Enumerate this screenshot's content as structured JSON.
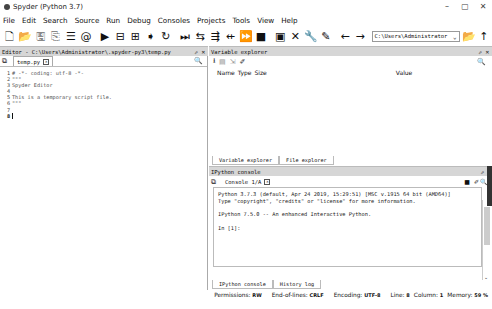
{
  "window": {
    "title": "Spyder (Python 3.7)",
    "controls": [
      "–",
      "▢",
      "✕"
    ]
  },
  "menu": [
    "File",
    "Edit",
    "Search",
    "Source",
    "Run",
    "Debug",
    "Consoles",
    "Projects",
    "Tools",
    "View",
    "Help"
  ],
  "toolbar": {
    "icons": [
      {
        "name": "new-file-icon",
        "glyph": "🗋"
      },
      {
        "name": "open-file-icon",
        "glyph": "📂"
      },
      {
        "name": "save-icon",
        "glyph": "🖫"
      },
      {
        "name": "save-all-icon",
        "glyph": "⎘"
      },
      {
        "name": "outline-icon",
        "glyph": "☰"
      },
      {
        "name": "preferences-icon",
        "glyph": "@"
      },
      {
        "name": "run-icon",
        "glyph": "▶"
      },
      {
        "name": "run-cell-icon",
        "glyph": "⊟"
      },
      {
        "name": "run-cell-advance-icon",
        "glyph": "⊞"
      },
      {
        "name": "run-selection-icon",
        "glyph": "➧"
      },
      {
        "name": "rerun-icon",
        "glyph": "↻"
      },
      {
        "name": "debug-icon",
        "glyph": "⏭"
      },
      {
        "name": "step-icon",
        "glyph": "⇆"
      },
      {
        "name": "step-into-icon",
        "glyph": "⇶"
      },
      {
        "name": "step-return-icon",
        "glyph": "⇷"
      },
      {
        "name": "continue-icon",
        "glyph": "⏩"
      },
      {
        "name": "stop-icon",
        "glyph": "■"
      },
      {
        "name": "maximize-pane-icon",
        "glyph": "▣"
      },
      {
        "name": "fullscreen-icon",
        "glyph": "✕"
      },
      {
        "name": "tools-icon",
        "glyph": "🔧"
      },
      {
        "name": "pythonpath-icon",
        "glyph": "✎"
      },
      {
        "name": "back-icon",
        "glyph": "←"
      },
      {
        "name": "forward-icon",
        "glyph": "→"
      }
    ],
    "path": "C:\\Users\\Administrator",
    "browse_glyph": "📂",
    "up_glyph": "↑"
  },
  "editor": {
    "header": "Editor - C:\\Users\\Administrator\\.spyder-py3\\temp.py",
    "header_controls": "⇗ ✕",
    "tab": "temp.py",
    "lines": [
      {
        "n": "1",
        "t": "# -*- coding: utf-8 -*-"
      },
      {
        "n": "2",
        "t": "\"\"\""
      },
      {
        "n": "3",
        "t": "Spyder Editor"
      },
      {
        "n": "4",
        "t": ""
      },
      {
        "n": "5",
        "t": "This is a temporary script file."
      },
      {
        "n": "6",
        "t": "\"\"\""
      },
      {
        "n": "7",
        "t": ""
      },
      {
        "n": "8",
        "t": ""
      }
    ]
  },
  "variable_explorer": {
    "header": "Variable explorer",
    "header_controls": "⇗ ✕",
    "columns": [
      "Name",
      "Type",
      "Size",
      "Value"
    ],
    "tabs": [
      "Variable explorer",
      "File explorer"
    ]
  },
  "console": {
    "header": "IPython console",
    "header_controls": "⇗",
    "tab": "Console 1/A",
    "output": [
      "Python 3.7.3 (default, Apr 24 2019, 15:29:51) [MSC v.1915 64 bit (AMD64)]",
      "Type \"copyright\", \"credits\" or \"license\" for more information.",
      "",
      "IPython 7.5.0 -- An enhanced Interactive Python.",
      "",
      "In [1]:"
    ],
    "tabs": [
      "IPython console",
      "History log"
    ]
  },
  "status": {
    "permissions_label": "Permissions:",
    "permissions": "RW",
    "eol_label": "End-of-lines:",
    "eol": "CRLF",
    "encoding_label": "Encoding:",
    "encoding": "UTF-8",
    "line_label": "Line:",
    "line": "8",
    "column_label": "Column:",
    "column": "1",
    "memory_label": "Memory:",
    "memory": "59 %"
  }
}
